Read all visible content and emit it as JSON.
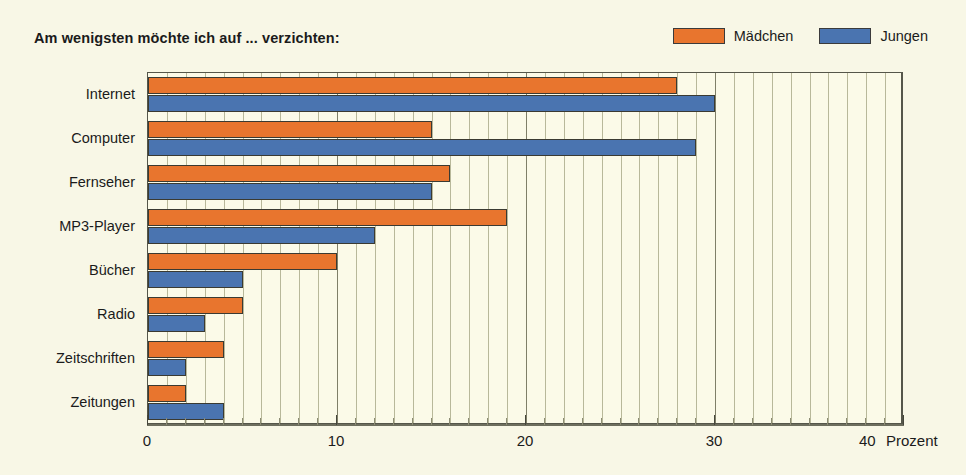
{
  "chart_data": {
    "type": "bar",
    "orientation": "horizontal",
    "title": "Am wenigsten möchte ich auf ... verzichten:",
    "xlabel": "Prozent",
    "ylabel": "",
    "xlim": [
      0,
      40
    ],
    "x_ticks": [
      0,
      10,
      20,
      30,
      40
    ],
    "x_tick_labels": [
      "0",
      "10",
      "20",
      "30",
      "40"
    ],
    "x_minor_tick_step": 1,
    "unit_label": "Prozent",
    "grid": true,
    "grid_axis": "x",
    "legend_position": "top-right",
    "categories": [
      "Internet",
      "Computer",
      "Fernseher",
      "MP3-Player",
      "Bücher",
      "Radio",
      "Zeitschriften",
      "Zeitungen"
    ],
    "series": [
      {
        "name": "Mädchen",
        "color": "#e8752e",
        "values": [
          28,
          15,
          16,
          19,
          10,
          5,
          4,
          2
        ]
      },
      {
        "name": "Jungen",
        "color": "#4a74b0",
        "values": [
          30,
          29,
          15,
          12,
          5,
          3,
          2,
          4
        ]
      }
    ]
  },
  "colors": {
    "background": "#f8f7e6",
    "plot_background": "#fbfae8",
    "gridline": "#b8b89a",
    "gridline_major": "#7f7f68",
    "axis": "#6d6e5e",
    "text": "#1b1b1b",
    "bar_outline": "#3a3a32",
    "girls": "#e8752e",
    "boys": "#4a74b0"
  }
}
